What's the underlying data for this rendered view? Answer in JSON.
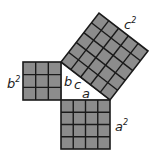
{
  "diagram": {
    "title": "",
    "labels": {
      "a_squared": "a",
      "b_squared": "b",
      "c_squared": "c",
      "exponent": "2",
      "side_a": "a",
      "side_b": "b",
      "side_c": "c"
    },
    "squares": [
      {
        "name": "b-squared",
        "grid": 3
      },
      {
        "name": "a-squared",
        "grid": 4
      },
      {
        "name": "c-squared",
        "grid": 5
      }
    ],
    "colors": {
      "fill": "#8c8c8c",
      "line": "#1a1a1a",
      "background": "#ffffff"
    }
  }
}
